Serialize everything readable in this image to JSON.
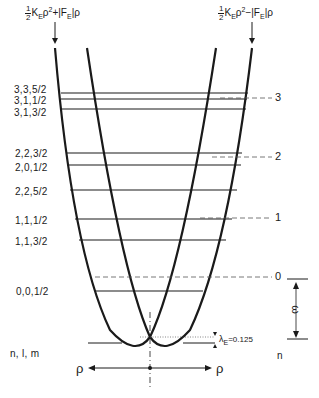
{
  "formulas": {
    "left": {
      "frac_num": "1",
      "frac_den": "2",
      "body": "K",
      "sub": "E",
      "rho": "ρ",
      "sup": "2",
      "sign": "+",
      "tail": "|F",
      "tail_sub": "E",
      "tail_end": "|ρ"
    },
    "right": {
      "frac_num": "1",
      "frac_den": "2",
      "body": "K",
      "sub": "E",
      "rho": "ρ",
      "sup": "2",
      "sign": "−",
      "tail": "|F",
      "tail_sub": "E",
      "tail_end": "|ρ"
    }
  },
  "levels_left": [
    {
      "label": "3,3,5/2",
      "y": 93
    },
    {
      "label": "3,1,1/2",
      "y": 99
    },
    {
      "label": "3,1,3/2",
      "y": 109
    },
    {
      "label": "2,2,3/2",
      "y": 153
    },
    {
      "label": "2,0,1/2",
      "y": 165
    },
    {
      "label": "2,2,5/2",
      "y": 190
    },
    {
      "label": "1,1,1/2",
      "y": 219
    },
    {
      "label": "1,1,3/2",
      "y": 240
    },
    {
      "label": "0,0,1/2",
      "y": 291
    }
  ],
  "levels_right": [
    {
      "label": "3",
      "y": 98
    },
    {
      "label": "2",
      "y": 157
    },
    {
      "label": "1",
      "y": 218
    },
    {
      "label": "0",
      "y": 277
    }
  ],
  "axis_labels": {
    "left_header": "n, l, m",
    "right_header": "n",
    "rho_left": "ρ",
    "rho_right": "ρ",
    "omega": "ω",
    "lambda": "λ",
    "lambda_sub": "E",
    "lambda_value": "=0.125"
  },
  "colors": {
    "ink": "#1a1a1a",
    "dashed": "#555555",
    "background": "#ffffff"
  }
}
